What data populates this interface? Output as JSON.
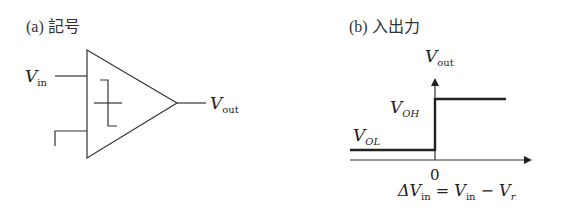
{
  "panel_a": {
    "title": "(a) 記号",
    "input_label": {
      "main": "V",
      "sub": "in"
    },
    "output_label": {
      "main": "V",
      "sub": "out"
    },
    "symbol": "comparator-with-hysteresis"
  },
  "panel_b": {
    "title": "(b) 入出力",
    "y_axis_label": {
      "main": "V",
      "sub": "out"
    },
    "high_label": {
      "main": "V",
      "sub": "OH"
    },
    "low_label": {
      "main": "V",
      "sub": "OL"
    },
    "origin_label": "0",
    "x_axis_label": {
      "delta": "ΔV",
      "delta_sub": "in",
      "eq": " = ",
      "v1": "V",
      "v1_sub": "in",
      "minus": " − ",
      "v2": "V",
      "v2_sub": "r"
    },
    "transfer": {
      "threshold": 0,
      "below_threshold": "V_OL",
      "above_threshold": "V_OH"
    }
  }
}
